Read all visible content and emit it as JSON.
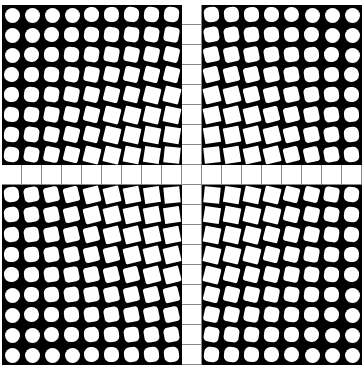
{
  "artwork": {
    "title": "",
    "grid": {
      "rows": 18,
      "cols": 18,
      "cell_px": 20
    },
    "cross": {
      "row": 8,
      "col": 9
    },
    "colors": {
      "background": "#000000",
      "shape": "#ffffff",
      "cross_line": "#888888"
    },
    "description": "Op-art grid of white shapes on black; circles at outer corners morph into rotated, then axis-aligned squares toward a central white cross of plain grid squares."
  }
}
